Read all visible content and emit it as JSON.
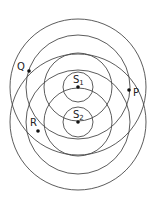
{
  "diagram": {
    "type": "two-source interference wavefronts",
    "line_color": "#4a4a4a",
    "dot_color": "#111111",
    "sources": [
      {
        "label": "S",
        "subscript": "1",
        "cx": 78,
        "cy": 87
      },
      {
        "label": "S",
        "subscript": "2",
        "cx": 78,
        "cy": 122
      }
    ],
    "radii": [
      15,
      34,
      52,
      68
    ],
    "points": [
      {
        "label": "Q",
        "x": 29,
        "y": 71,
        "lx": 17,
        "ly": 70
      },
      {
        "label": "P",
        "x": 129,
        "y": 90,
        "lx": 133,
        "ly": 96
      },
      {
        "label": "R",
        "x": 38,
        "y": 131,
        "lx": 30,
        "ly": 126
      }
    ]
  }
}
